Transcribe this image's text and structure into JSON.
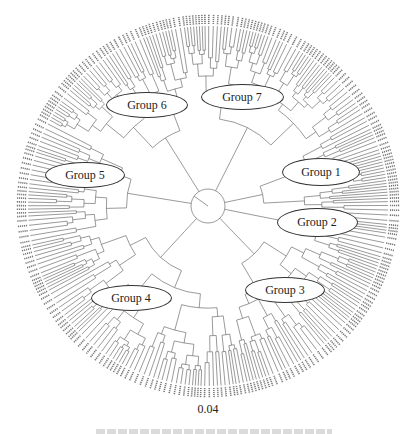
{
  "figure": {
    "type": "circular-phylogenetic-tree",
    "center": [
      208,
      206
    ],
    "root_circle_radius": 17,
    "tip_radius": 180,
    "label_radius": 189,
    "leaf_count": 300,
    "line_color": "#555555",
    "scale_label": "0.04",
    "caption_visible": false
  },
  "groups": [
    {
      "id": 1,
      "label": "Group 1",
      "center": [
        321,
        172
      ],
      "size": [
        78,
        28
      ],
      "arc_deg": [
        -30,
        2
      ]
    },
    {
      "id": 2,
      "label": "Group 2",
      "center": [
        317,
        222
      ],
      "size": [
        81,
        29
      ],
      "arc_deg": [
        2,
        20
      ]
    },
    {
      "id": 3,
      "label": "Group 3",
      "center": [
        285,
        290
      ],
      "size": [
        80,
        26
      ],
      "arc_deg": [
        20,
        78
      ]
    },
    {
      "id": 4,
      "label": "Group 4",
      "center": [
        131,
        298
      ],
      "size": [
        81,
        26
      ],
      "arc_deg": [
        78,
        168
      ]
    },
    {
      "id": 5,
      "label": "Group 5",
      "center": [
        85,
        175
      ],
      "size": [
        80,
        26
      ],
      "arc_deg": [
        168,
        208
      ]
    },
    {
      "id": 6,
      "label": "Group 6",
      "center": [
        147,
        105
      ],
      "size": [
        82,
        26
      ],
      "arc_deg": [
        208,
        262
      ]
    },
    {
      "id": 7,
      "label": "Group 7",
      "center": [
        242,
        97
      ],
      "size": [
        83,
        26
      ],
      "arc_deg": [
        262,
        330
      ]
    }
  ]
}
